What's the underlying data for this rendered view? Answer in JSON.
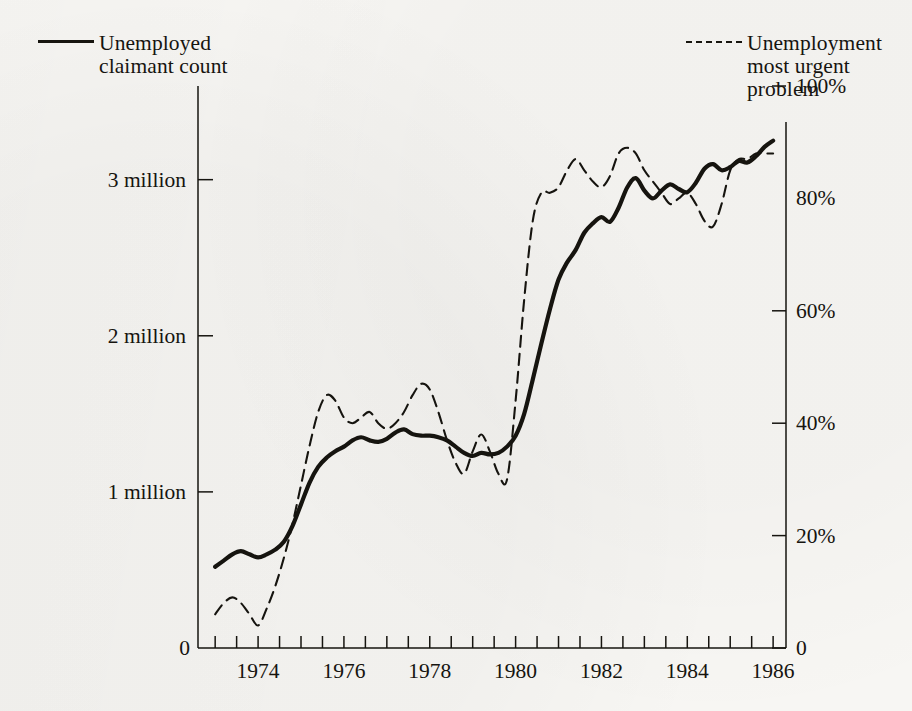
{
  "legend": {
    "solid": {
      "label": "Unemployed\nclaimant count",
      "style": "solid",
      "color": "#17150f"
    },
    "dashed": {
      "label": "Unemployment\nmost urgent\nproblem",
      "style": "dashed",
      "color": "#17150f"
    }
  },
  "axes": {
    "y_left": {
      "ticks": [
        "0",
        "1 million",
        "2 million",
        "3 million"
      ],
      "values": [
        0,
        1,
        2,
        3
      ],
      "range": [
        0,
        3.6
      ]
    },
    "y_right": {
      "ticks": [
        "0",
        "20%",
        "40%",
        "60%",
        "80%",
        "100%"
      ],
      "values": [
        0,
        20,
        40,
        60,
        80,
        100
      ],
      "range": [
        0,
        100
      ]
    },
    "x": {
      "ticks": [
        "1974",
        "1976",
        "1978",
        "1980",
        "1982",
        "1984",
        "1986"
      ],
      "values": [
        1974,
        1976,
        1978,
        1980,
        1982,
        1984,
        1986
      ],
      "range": [
        1972.6,
        1986.3
      ],
      "minor_tick_step": 0.5
    }
  },
  "chart_data": {
    "type": "line",
    "title": "",
    "xlabel": "",
    "ylabel": "",
    "xlim": [
      1972.6,
      1986.3
    ],
    "grid": false,
    "legend_position": "top",
    "series": [
      {
        "name": "Unemployed claimant count",
        "style": "solid",
        "unit": "millions",
        "axis": "left",
        "ylim": [
          0,
          3.6
        ],
        "points": [
          [
            1973.0,
            0.52
          ],
          [
            1973.2,
            0.56
          ],
          [
            1973.4,
            0.6
          ],
          [
            1973.6,
            0.62
          ],
          [
            1973.8,
            0.6
          ],
          [
            1974.0,
            0.58
          ],
          [
            1974.2,
            0.6
          ],
          [
            1974.4,
            0.63
          ],
          [
            1974.6,
            0.68
          ],
          [
            1974.8,
            0.78
          ],
          [
            1975.0,
            0.92
          ],
          [
            1975.2,
            1.06
          ],
          [
            1975.4,
            1.16
          ],
          [
            1975.6,
            1.22
          ],
          [
            1975.8,
            1.26
          ],
          [
            1976.0,
            1.29
          ],
          [
            1976.2,
            1.33
          ],
          [
            1976.4,
            1.35
          ],
          [
            1976.6,
            1.33
          ],
          [
            1976.8,
            1.32
          ],
          [
            1977.0,
            1.34
          ],
          [
            1977.2,
            1.38
          ],
          [
            1977.4,
            1.4
          ],
          [
            1977.6,
            1.37
          ],
          [
            1977.8,
            1.36
          ],
          [
            1978.0,
            1.36
          ],
          [
            1978.2,
            1.35
          ],
          [
            1978.4,
            1.33
          ],
          [
            1978.6,
            1.29
          ],
          [
            1978.8,
            1.25
          ],
          [
            1979.0,
            1.23
          ],
          [
            1979.2,
            1.25
          ],
          [
            1979.4,
            1.24
          ],
          [
            1979.6,
            1.25
          ],
          [
            1979.8,
            1.29
          ],
          [
            1980.0,
            1.36
          ],
          [
            1980.2,
            1.5
          ],
          [
            1980.4,
            1.72
          ],
          [
            1980.6,
            1.95
          ],
          [
            1980.8,
            2.17
          ],
          [
            1981.0,
            2.36
          ],
          [
            1981.2,
            2.47
          ],
          [
            1981.4,
            2.55
          ],
          [
            1981.6,
            2.66
          ],
          [
            1981.8,
            2.72
          ],
          [
            1982.0,
            2.76
          ],
          [
            1982.2,
            2.73
          ],
          [
            1982.4,
            2.82
          ],
          [
            1982.6,
            2.95
          ],
          [
            1982.8,
            3.01
          ],
          [
            1983.0,
            2.93
          ],
          [
            1983.2,
            2.88
          ],
          [
            1983.4,
            2.93
          ],
          [
            1983.6,
            2.97
          ],
          [
            1983.8,
            2.94
          ],
          [
            1984.0,
            2.92
          ],
          [
            1984.2,
            2.98
          ],
          [
            1984.4,
            3.07
          ],
          [
            1984.6,
            3.1
          ],
          [
            1984.8,
            3.06
          ],
          [
            1985.0,
            3.08
          ],
          [
            1985.2,
            3.12
          ],
          [
            1985.4,
            3.11
          ],
          [
            1985.6,
            3.15
          ],
          [
            1985.8,
            3.21
          ],
          [
            1986.0,
            3.25
          ]
        ]
      },
      {
        "name": "Unemployment most urgent problem",
        "style": "dashed",
        "unit": "percent",
        "axis": "right",
        "ylim": [
          0,
          100
        ],
        "points": [
          [
            1973.0,
            6
          ],
          [
            1973.2,
            8
          ],
          [
            1973.4,
            9
          ],
          [
            1973.6,
            8
          ],
          [
            1973.8,
            6
          ],
          [
            1974.0,
            4
          ],
          [
            1974.2,
            7
          ],
          [
            1974.4,
            11
          ],
          [
            1974.6,
            16
          ],
          [
            1974.8,
            22
          ],
          [
            1975.0,
            29
          ],
          [
            1975.2,
            36
          ],
          [
            1975.4,
            42
          ],
          [
            1975.6,
            45
          ],
          [
            1975.8,
            44
          ],
          [
            1976.0,
            41
          ],
          [
            1976.2,
            40
          ],
          [
            1976.4,
            41
          ],
          [
            1976.6,
            42
          ],
          [
            1976.8,
            40
          ],
          [
            1977.0,
            39
          ],
          [
            1977.2,
            40
          ],
          [
            1977.4,
            42
          ],
          [
            1977.6,
            45
          ],
          [
            1977.8,
            47
          ],
          [
            1978.0,
            46
          ],
          [
            1978.2,
            42
          ],
          [
            1978.4,
            37
          ],
          [
            1978.6,
            33
          ],
          [
            1978.8,
            31
          ],
          [
            1979.0,
            35
          ],
          [
            1979.2,
            38
          ],
          [
            1979.4,
            35
          ],
          [
            1979.6,
            31
          ],
          [
            1979.8,
            30
          ],
          [
            1980.0,
            44
          ],
          [
            1980.2,
            62
          ],
          [
            1980.4,
            76
          ],
          [
            1980.6,
            81
          ],
          [
            1980.8,
            81
          ],
          [
            1981.0,
            82
          ],
          [
            1981.2,
            85
          ],
          [
            1981.4,
            87
          ],
          [
            1981.6,
            85
          ],
          [
            1981.8,
            83
          ],
          [
            1982.0,
            82
          ],
          [
            1982.2,
            84
          ],
          [
            1982.4,
            88
          ],
          [
            1982.6,
            89
          ],
          [
            1982.8,
            88
          ],
          [
            1983.0,
            85
          ],
          [
            1983.2,
            83
          ],
          [
            1983.4,
            81
          ],
          [
            1983.6,
            79
          ],
          [
            1983.8,
            80
          ],
          [
            1984.0,
            81
          ],
          [
            1984.2,
            79
          ],
          [
            1984.4,
            76
          ],
          [
            1984.6,
            75
          ],
          [
            1984.8,
            79
          ],
          [
            1985.0,
            85
          ],
          [
            1985.2,
            87
          ],
          [
            1985.4,
            87
          ],
          [
            1985.6,
            88
          ],
          [
            1985.8,
            88
          ],
          [
            1986.0,
            88
          ]
        ]
      }
    ]
  }
}
